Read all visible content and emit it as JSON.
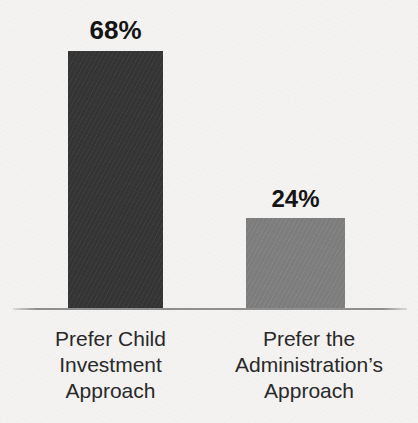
{
  "chart_data": {
    "type": "bar",
    "title": "",
    "subtitle": "",
    "xlabel": "",
    "ylabel": "",
    "ylim": [
      0,
      100
    ],
    "grid": false,
    "legend": "none",
    "orientation": "vertical",
    "categories": [
      "Prefer Child Investment Approach",
      "Prefer the Administration’s Approach"
    ],
    "values": [
      68,
      24
    ],
    "value_labels": [
      "68%",
      "24%"
    ],
    "bar_colors": [
      "#343434",
      "#808080"
    ],
    "category_lines": [
      [
        "Prefer Child",
        "Investment",
        "Approach"
      ],
      [
        "Prefer the",
        "Administration’s",
        "Approach"
      ]
    ],
    "axis_color": "#8e8e8e",
    "background_color": "#f4f3f1",
    "label_text_color": "#272727",
    "value_text_color": "#111111"
  }
}
